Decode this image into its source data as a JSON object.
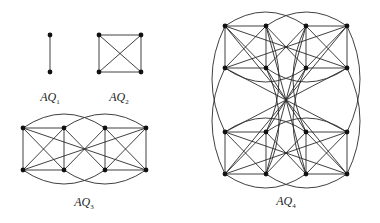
{
  "figure": {
    "colors": {
      "edge": "#2a2a2a",
      "node": "#111111",
      "background": "#ffffff"
    },
    "graphs": [
      {
        "id": "AQ1",
        "label_main": "AQ",
        "label_sub": "1",
        "label_pos": [
          50,
          90
        ],
        "dimension": 1,
        "layout": {
          "cols_x": [
            50
          ],
          "rows_y": [
            35,
            72
          ]
        }
      },
      {
        "id": "AQ2",
        "label_main": "AQ",
        "label_sub": "2",
        "label_pos": [
          119,
          90
        ],
        "dimension": 2,
        "layout": {
          "cols_x": [
            99,
            141
          ],
          "rows_y": [
            35,
            72
          ]
        }
      },
      {
        "id": "AQ3",
        "label_main": "AQ",
        "label_sub": "3",
        "label_pos": [
          84,
          195
        ],
        "dimension": 3,
        "layout": {
          "cols_x": [
            23,
            64,
            105,
            146
          ],
          "rows_y": [
            128,
            170
          ],
          "arc_height": 14
        }
      },
      {
        "id": "AQ4",
        "label_main": "AQ",
        "label_sub": "4",
        "label_pos": [
          286,
          194
        ],
        "dimension": 4,
        "layout": {
          "cols_x": [
            225,
            266,
            306,
            347
          ],
          "rows_y": [
            26,
            68,
            132,
            174
          ],
          "arc_height": 14,
          "side_arc": 13
        }
      }
    ]
  }
}
